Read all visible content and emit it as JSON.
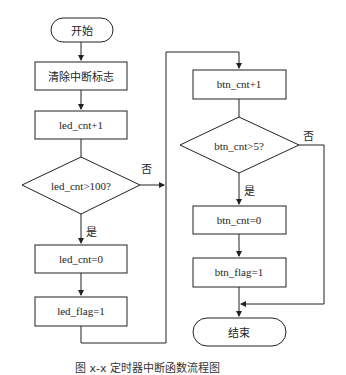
{
  "flowchart": {
    "nodes": {
      "start": "开始",
      "clear_flag": "清除中断标志",
      "led_inc": "led_cnt+1",
      "led_cond": "led_cnt>100?",
      "led_reset": "led_cnt=0",
      "led_flag": "led_flag=1",
      "btn_inc": "btn_cnt+1",
      "btn_cond": "btn_cnt>5?",
      "btn_reset": "btn_cnt=0",
      "btn_flag": "btn_flag=1",
      "end": "结束"
    },
    "labels": {
      "led_no": "否",
      "led_yes": "是",
      "btn_no": "否",
      "btn_yes": "是"
    },
    "caption": "图 x-x  定时器中断函数流程图",
    "colors": {
      "stroke": "#222222",
      "background": "#ffffff"
    }
  }
}
